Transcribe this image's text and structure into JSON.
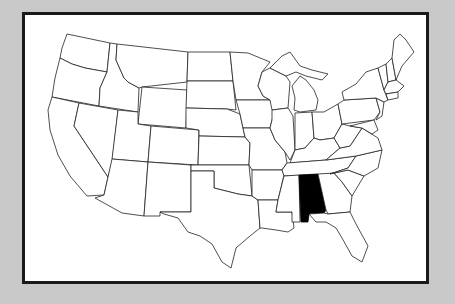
{
  "map": {
    "title": "United States map",
    "highlighted_state": "Alabama",
    "highlight_color": "#000000",
    "state_fill": "#ffffff",
    "border_color": "#222222",
    "background_color": "#c9c9c9",
    "frame_color": "#1a1a1a"
  }
}
